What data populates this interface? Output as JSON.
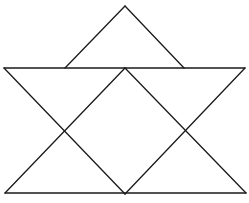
{
  "diagram": {
    "stroke_color": "#1a1a1a",
    "background_color": "#ffffff",
    "shapes": [
      {
        "name": "top-triangle",
        "kind": "triangle"
      },
      {
        "name": "inverted-triangle",
        "kind": "triangle"
      },
      {
        "name": "upright-triangle",
        "kind": "triangle"
      },
      {
        "name": "center-diamond",
        "kind": "rhombus"
      }
    ]
  }
}
